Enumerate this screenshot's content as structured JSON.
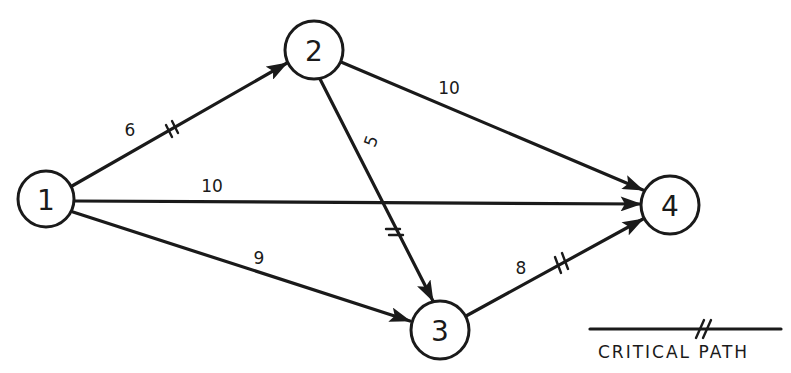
{
  "diagram": {
    "type": "activity-network",
    "nodes": [
      {
        "id": "1",
        "label": "1",
        "x": 46,
        "y": 199
      },
      {
        "id": "2",
        "label": "2",
        "x": 314,
        "y": 50
      },
      {
        "id": "3",
        "label": "3",
        "x": 440,
        "y": 330
      },
      {
        "id": "4",
        "label": "4",
        "x": 670,
        "y": 205
      }
    ],
    "edges": [
      {
        "from": "1",
        "to": "2",
        "weight": "6",
        "critical": true
      },
      {
        "from": "1",
        "to": "4",
        "weight": "10",
        "critical": false
      },
      {
        "from": "1",
        "to": "3",
        "weight": "9",
        "critical": false
      },
      {
        "from": "2",
        "to": "4",
        "weight": "10",
        "critical": false
      },
      {
        "from": "2",
        "to": "3",
        "weight": "5",
        "critical": true
      },
      {
        "from": "3",
        "to": "4",
        "weight": "8",
        "critical": true
      }
    ],
    "legend": {
      "label": "CRITICAL PATH",
      "symbol": "//"
    }
  }
}
